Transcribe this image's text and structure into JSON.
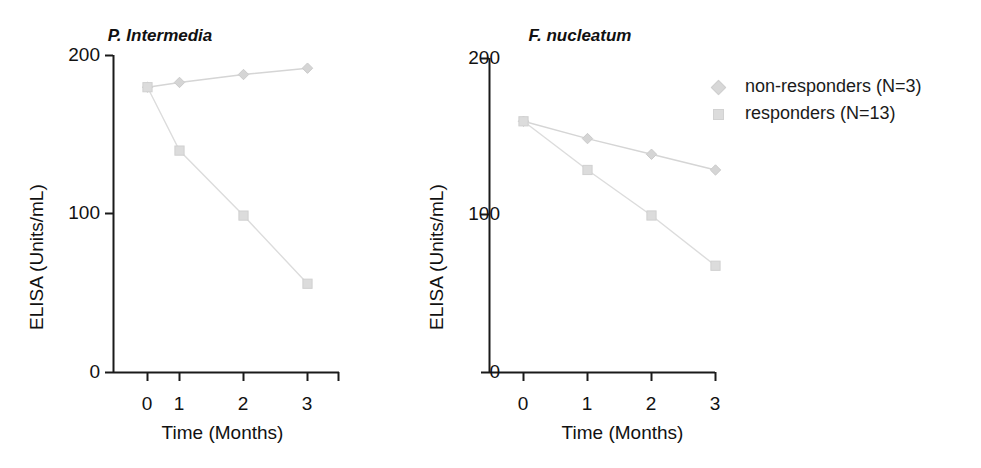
{
  "figure": {
    "background": "#ffffff",
    "axis_color": "#1a1a1a",
    "series_color_nonresponders": "#d5d5d5",
    "series_color_responders": "#dcdcdc"
  },
  "legend": {
    "position": "right",
    "entries": [
      {
        "label": "non-responders (N=3)",
        "marker": "diamond-marker-icon",
        "color": "#d5d5d5"
      },
      {
        "label": "responders (N=13)",
        "marker": "square-marker-icon",
        "color": "#dcdcdc"
      }
    ]
  },
  "chart_data": [
    {
      "type": "line",
      "title": "P. Intermedia",
      "xlabel": "Time (Months)",
      "ylabel": "ELISA (Units/mL)",
      "x": [
        0,
        1,
        2,
        3
      ],
      "xticklabels": [
        "0",
        "1",
        "2",
        "3"
      ],
      "yticks": [
        0,
        100,
        200
      ],
      "yticklabels": [
        "0",
        "100",
        "200"
      ],
      "xlim": [
        -0.25,
        3.35
      ],
      "ylim": [
        0,
        200
      ],
      "grid": false,
      "series": [
        {
          "name": "non-responders (N=3)",
          "marker": "diamond",
          "values": [
            180,
            183,
            188,
            192
          ]
        },
        {
          "name": "responders (N=13)",
          "marker": "square",
          "values": [
            180,
            140,
            99,
            56
          ]
        }
      ]
    },
    {
      "type": "line",
      "title": "F. nucleatum",
      "xlabel": "Time (Months)",
      "ylabel": "ELISA (Units/mL)",
      "x": [
        0,
        1,
        2,
        3
      ],
      "xticklabels": [
        "0",
        "1",
        "2",
        "3"
      ],
      "yticks": [
        0,
        100,
        200
      ],
      "yticklabels": [
        "0",
        "100",
        "200"
      ],
      "xlim": [
        -0.25,
        3.35
      ],
      "ylim": [
        0,
        200
      ],
      "grid": false,
      "series": [
        {
          "name": "non-responders (N=3)",
          "marker": "diamond",
          "values": [
            160,
            149,
            139,
            129
          ]
        },
        {
          "name": "responders (N=13)",
          "marker": "square",
          "values": [
            160,
            129,
            100,
            68
          ]
        }
      ]
    }
  ]
}
